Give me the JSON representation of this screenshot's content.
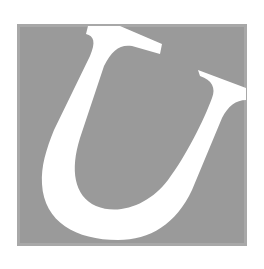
{
  "dropcap": {
    "letter": "U",
    "box_color": "#9a9a9a",
    "letter_color": "#ffffff"
  }
}
